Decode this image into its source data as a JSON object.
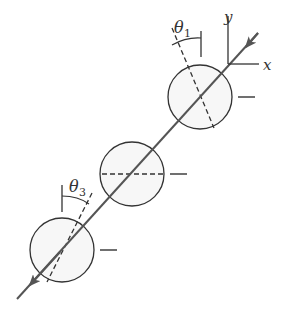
{
  "diagram": {
    "axes": {
      "x_label": "x",
      "y_label": "y"
    },
    "angles": [
      {
        "symbol": "θ",
        "subscript": "1",
        "attached_to": "top-circle"
      },
      {
        "symbol": "θ",
        "subscript": "3",
        "attached_to": "bottom-circle"
      }
    ],
    "circles": [
      {
        "name": "top-circle",
        "dashed_line": "tilted"
      },
      {
        "name": "middle-circle",
        "dashed_line": "horizontal"
      },
      {
        "name": "bottom-circle",
        "dashed_line": "tilted"
      }
    ],
    "colors": {
      "line": "#555555",
      "circle_fill": "#f7f7f7",
      "stroke": "#333333"
    }
  }
}
